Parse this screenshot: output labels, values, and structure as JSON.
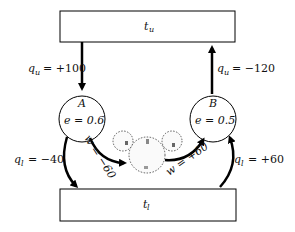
{
  "reservoirs": {
    "upper": {
      "label": "t",
      "sub": "u"
    },
    "lower": {
      "label": "t",
      "sub": "l"
    }
  },
  "engines": [
    {
      "name": "A",
      "efficiency": "e = 0.6"
    },
    {
      "name": "B",
      "efficiency": "e = 0.5"
    }
  ],
  "flows": {
    "qu_A": {
      "sym": "q",
      "sub": "u",
      "value": "= +100"
    },
    "qu_B": {
      "sym": "q",
      "sub": "u",
      "value": "= −120"
    },
    "ql_A": {
      "sym": "q",
      "sub": "l",
      "value": "= −40"
    },
    "ql_B": {
      "sym": "q",
      "sub": "l",
      "value": "= +60"
    },
    "w_A": {
      "text": "w = −60"
    },
    "w_B": {
      "text": "w = +60"
    }
  }
}
